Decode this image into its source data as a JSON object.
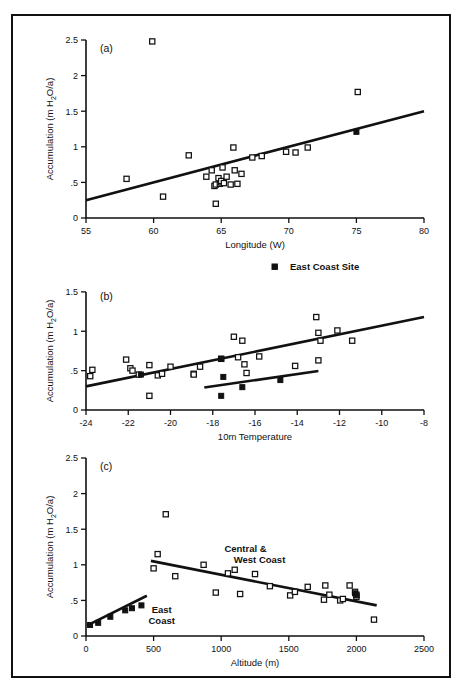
{
  "figure": {
    "background": "#ffffff",
    "ink": "#111111",
    "legend": {
      "label": "East Coast Site",
      "marker": "filled-square"
    },
    "shared_ylabel": "Accumulation (m H",
    "shared_ylabel_sub": "2",
    "shared_ylabel_tail": "O/a)"
  },
  "chart_data": [
    {
      "type": "scatter",
      "panel": "(a)",
      "title": "",
      "xlabel": "Longitude (W)",
      "ylabel": "Accumulation (m H2O/a)",
      "xlim": [
        55,
        80
      ],
      "ylim": [
        0,
        2.5
      ],
      "xticks": [
        55,
        60,
        65,
        70,
        75,
        80
      ],
      "xticklabels": [
        "55",
        "60",
        "65",
        "70",
        "75",
        "80"
      ],
      "yticks": [
        0,
        0.5,
        1,
        1.5,
        2,
        2.5
      ],
      "yticklabels": [
        "0",
        ".5",
        "1",
        "1.5",
        "2",
        "2.5"
      ],
      "grid": false,
      "legend_position": "none",
      "series": [
        {
          "name": "Central & West Coast sites",
          "marker": "open-square",
          "points": [
            [
              58.0,
              0.55
            ],
            [
              59.9,
              2.48
            ],
            [
              60.7,
              0.3
            ],
            [
              62.6,
              0.88
            ],
            [
              63.9,
              0.58
            ],
            [
              64.3,
              0.67
            ],
            [
              64.5,
              0.45
            ],
            [
              64.6,
              0.47
            ],
            [
              64.6,
              0.2
            ],
            [
              64.8,
              0.56
            ],
            [
              64.9,
              0.48
            ],
            [
              65.0,
              0.5
            ],
            [
              65.0,
              0.52
            ],
            [
              65.1,
              0.71
            ],
            [
              65.2,
              0.49
            ],
            [
              65.4,
              0.58
            ],
            [
              65.7,
              0.47
            ],
            [
              65.9,
              0.99
            ],
            [
              66.0,
              0.67
            ],
            [
              66.2,
              0.48
            ],
            [
              66.5,
              0.62
            ],
            [
              67.3,
              0.85
            ],
            [
              68.0,
              0.87
            ],
            [
              69.8,
              0.93
            ],
            [
              70.5,
              0.92
            ],
            [
              71.4,
              0.99
            ],
            [
              75.1,
              1.77
            ]
          ]
        },
        {
          "name": "East Coast Site",
          "marker": "filled-square",
          "points": [
            [
              75.0,
              1.21
            ]
          ]
        }
      ],
      "fit_lines": [
        {
          "name": "overall trend",
          "x": [
            55,
            80
          ],
          "y": [
            0.25,
            1.5
          ]
        }
      ]
    },
    {
      "type": "scatter",
      "panel": "(b)",
      "title": "",
      "xlabel": "10m Temperature",
      "ylabel": "Accumulation (m H2O/a)",
      "xlim": [
        -24,
        -8
      ],
      "ylim": [
        0,
        1.6
      ],
      "xticks": [
        -24,
        -22,
        -20,
        -18,
        -16,
        -14,
        -12,
        -10,
        -8
      ],
      "xticklabels": [
        "-24",
        "-22",
        "-20",
        "-18",
        "-16",
        "-14",
        "-12",
        "-10",
        "-8"
      ],
      "yticks": [
        0,
        0.5,
        1,
        1.5
      ],
      "yticklabels": [
        "0",
        ".5",
        "1",
        "1.5"
      ],
      "grid": false,
      "legend_position": "above-right",
      "series": [
        {
          "name": "Central & West Coast sites",
          "marker": "open-square",
          "points": [
            [
              -23.7,
              0.51
            ],
            [
              -23.8,
              0.43
            ],
            [
              -22.1,
              0.64
            ],
            [
              -21.9,
              0.53
            ],
            [
              -21.8,
              0.5
            ],
            [
              -21.5,
              0.45
            ],
            [
              -21.0,
              0.57
            ],
            [
              -21.0,
              0.18
            ],
            [
              -20.6,
              0.44
            ],
            [
              -20.4,
              0.46
            ],
            [
              -20.0,
              0.55
            ],
            [
              -18.6,
              0.55
            ],
            [
              -18.9,
              0.46
            ],
            [
              -18.9,
              0.45
            ],
            [
              -17.6,
              0.65
            ],
            [
              -17.0,
              0.93
            ],
            [
              -16.8,
              0.67
            ],
            [
              -16.6,
              0.88
            ],
            [
              -16.5,
              0.58
            ],
            [
              -16.4,
              0.47
            ],
            [
              -15.8,
              0.68
            ],
            [
              -14.1,
              0.56
            ],
            [
              -13.1,
              1.18
            ],
            [
              -13.0,
              0.98
            ],
            [
              -13.0,
              0.63
            ],
            [
              -12.9,
              0.88
            ],
            [
              -12.1,
              1.01
            ],
            [
              -11.4,
              0.88
            ]
          ]
        },
        {
          "name": "East Coast Site",
          "marker": "filled-square",
          "points": [
            [
              -21.4,
              0.45
            ],
            [
              -17.6,
              0.65
            ],
            [
              -17.6,
              0.18
            ],
            [
              -17.5,
              0.42
            ],
            [
              -16.6,
              0.29
            ],
            [
              -14.8,
              0.38
            ]
          ]
        }
      ],
      "fit_lines": [
        {
          "name": "central-west trend",
          "x": [
            -24,
            -8
          ],
          "y": [
            0.3,
            1.18
          ]
        },
        {
          "name": "east coast trend",
          "x": [
            -18.4,
            -13.0
          ],
          "y": [
            0.285,
            0.495
          ]
        }
      ]
    },
    {
      "type": "scatter",
      "panel": "(c)",
      "title": "",
      "xlabel": "Altitude (m)",
      "ylabel": "Accumulation (m H2O/a)",
      "xlim": [
        0,
        2500
      ],
      "ylim": [
        0,
        2.5
      ],
      "xticks": [
        0,
        500,
        1000,
        1500,
        2000,
        2500
      ],
      "xticklabels": [
        "0",
        "500",
        "1000",
        "1500",
        "2000",
        "2500"
      ],
      "yticks": [
        0,
        0.5,
        1,
        1.5,
        2,
        2.5
      ],
      "yticklabels": [
        "0",
        ".5",
        "1",
        "1.5",
        "2",
        "2.5"
      ],
      "grid": false,
      "legend_position": "none",
      "annotations": [
        {
          "text_line1": "Central &",
          "text_line2": "West Coast",
          "x": 1180,
          "y": 1.18
        },
        {
          "text_line1": "East",
          "text_line2": "Coast",
          "x": 560,
          "y": 0.33
        }
      ],
      "series": [
        {
          "name": "Central & West Coast sites",
          "marker": "open-square",
          "points": [
            [
              500,
              0.95
            ],
            [
              530,
              1.15
            ],
            [
              590,
              1.71
            ],
            [
              660,
              0.84
            ],
            [
              870,
              1.0
            ],
            [
              960,
              0.61
            ],
            [
              1050,
              0.88
            ],
            [
              1100,
              0.93
            ],
            [
              1140,
              0.59
            ],
            [
              1250,
              0.87
            ],
            [
              1360,
              0.7
            ],
            [
              1510,
              0.57
            ],
            [
              1545,
              0.62
            ],
            [
              1640,
              0.69
            ],
            [
              1760,
              0.51
            ],
            [
              1770,
              0.71
            ],
            [
              1800,
              0.58
            ],
            [
              1880,
              0.5
            ],
            [
              1900,
              0.52
            ],
            [
              1950,
              0.71
            ],
            [
              1990,
              0.62
            ],
            [
              2000,
              0.58
            ],
            [
              2000,
              0.55
            ],
            [
              2130,
              0.23
            ]
          ]
        },
        {
          "name": "East Coast Site",
          "marker": "filled-square",
          "points": [
            [
              30,
              0.155
            ],
            [
              90,
              0.185
            ],
            [
              180,
              0.27
            ],
            [
              290,
              0.36
            ],
            [
              340,
              0.39
            ],
            [
              410,
              0.43
            ],
            [
              1990,
              0.6
            ],
            [
              2000,
              0.57
            ]
          ]
        }
      ],
      "fit_lines": [
        {
          "name": "central-west trend",
          "x": [
            480,
            2150
          ],
          "y": [
            1.055,
            0.43
          ]
        },
        {
          "name": "east coast trend",
          "x": [
            10,
            450
          ],
          "y": [
            0.15,
            0.565
          ]
        }
      ]
    }
  ]
}
